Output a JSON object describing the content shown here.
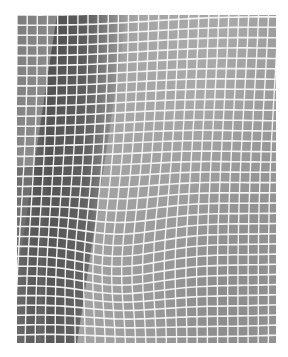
{
  "image": {
    "subject": "white grid mesh fabric over gray surface",
    "description": "Close-up black-and-white photograph of a square white thread grid laid over a gray material; a darker diagonal band runs down the left third and the grid lines warp and bend toward the lower middle.",
    "frame": {
      "left": 17,
      "top": 15,
      "width": 259,
      "height": 328
    },
    "grid": {
      "cell_spacing_px": 10,
      "line_color": "#f4f4f4",
      "line_width_px": 1.6
    },
    "tones": {
      "page_background": "#ffffff",
      "base_gray": "#8e8e8e",
      "light_gray": "#a8a8a8",
      "dark_band": "#4a4a4a",
      "lower_right_gray": "#8a8a8a"
    }
  }
}
